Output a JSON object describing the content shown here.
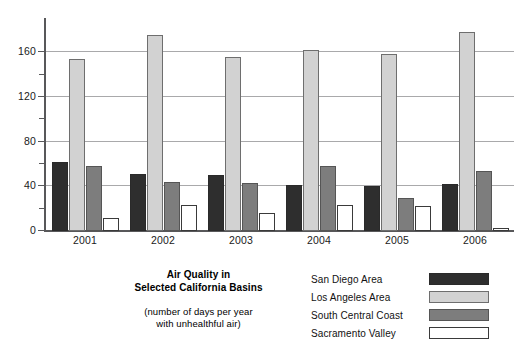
{
  "chart_data": {
    "type": "bar",
    "title": "Air Quality in Selected California Basins",
    "title_line1": "Air Quality in",
    "title_line2": "Selected California Basins",
    "subtitle_line1": "(number of days per year",
    "subtitle_line2": "with unhealthful air)",
    "xlabel": "",
    "ylabel": "",
    "ylim": [
      0,
      190
    ],
    "grid": true,
    "legend_position": "bottom-right",
    "categories": [
      "2001",
      "2002",
      "2003",
      "2004",
      "2005",
      "2006"
    ],
    "y_major_ticks": [
      0,
      40,
      80,
      120,
      160
    ],
    "y_minor_ticks": [
      20,
      60,
      100,
      140
    ],
    "y_tick_labels": [
      "0",
      "40",
      "80",
      "120",
      "160"
    ],
    "series": [
      {
        "name": "San Diego Area",
        "color": "#2e2e2e",
        "values": [
          62,
          51,
          50,
          41,
          40,
          42
        ]
      },
      {
        "name": "Los Angeles Area",
        "color": "#d2d2d2",
        "values": [
          154,
          176,
          156,
          162,
          159,
          178
        ]
      },
      {
        "name": "South Central Coast",
        "color": "#7d7d7d",
        "values": [
          58,
          44,
          43,
          58,
          30,
          54
        ]
      },
      {
        "name": "Sacramento Valley",
        "color": "#ffffff",
        "values": [
          12,
          23,
          16,
          23,
          22,
          3
        ]
      }
    ]
  },
  "legend": {
    "items": [
      {
        "label": "San Diego Area",
        "swatch": "sw-sd"
      },
      {
        "label": "Los Angeles Area",
        "swatch": "sw-la"
      },
      {
        "label": "South Central Coast",
        "swatch": "sw-sc"
      },
      {
        "label": "Sacramento Valley",
        "swatch": "sw-sv"
      }
    ]
  }
}
